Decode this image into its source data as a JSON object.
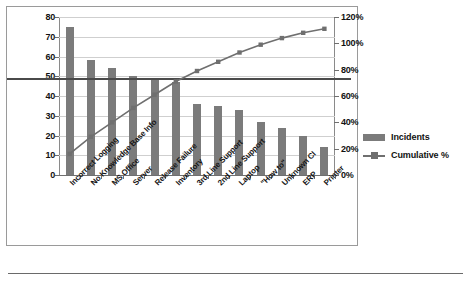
{
  "chart_data": {
    "type": "bar",
    "title": "",
    "subtitle": "",
    "xlabel": "",
    "ylabel": "",
    "categories": [
      "Incorrect Logging",
      "No Knowledge Base Info",
      "MS Office",
      "Server",
      "Release Failure",
      "Inventory",
      "3rd Line Support",
      "2nd Line Support",
      "Laptop",
      "\"How to\"",
      "Unknown CI",
      "ERP",
      "Printer"
    ],
    "series": [
      {
        "name": "Incidents",
        "type": "bar",
        "axis": "left",
        "color": "#7b7b7b",
        "values": [
          75,
          58,
          54,
          50,
          48,
          47,
          36,
          35,
          33,
          27,
          24,
          20,
          14
        ]
      },
      {
        "name": "Cumulative %",
        "type": "line",
        "axis": "right",
        "color": "#6f6f6f",
        "marker": "square",
        "values": [
          16,
          29,
          40,
          51,
          61,
          71,
          79,
          86,
          93,
          99,
          104,
          108,
          111
        ]
      }
    ],
    "left_axis": {
      "label": "",
      "min": 0,
      "max": 80,
      "step": 10,
      "ticks": [
        "0",
        "10",
        "20",
        "30",
        "40",
        "50",
        "60",
        "70",
        "80"
      ]
    },
    "right_axis": {
      "label": "",
      "min": 0,
      "max": 120,
      "step": 20,
      "ticks": [
        "0%",
        "20%",
        "40%",
        "60%",
        "80%",
        "100%",
        "120%"
      ]
    },
    "reference_line": {
      "name": "target-line",
      "left_value": 49,
      "right_value_percent": 73
    },
    "grid": true,
    "legend": {
      "position": "right",
      "entries": [
        {
          "label": "Incidents",
          "marker": "bar-swatch",
          "color": "#7b7b7b"
        },
        {
          "label": "Cumulative %",
          "marker": "line-square",
          "color": "#6f6f6f"
        }
      ]
    }
  }
}
